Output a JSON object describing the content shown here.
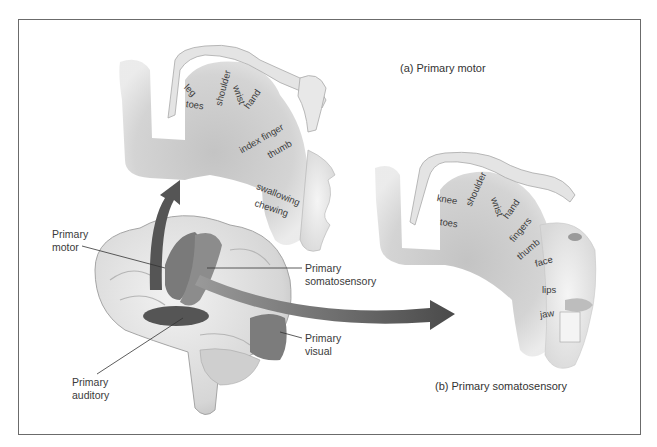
{
  "figure": {
    "captions": {
      "motor": "(a) Primary motor",
      "somatosensory": "(b) Primary somatosensory"
    },
    "brain_labels": {
      "primary_motor": [
        "Primary",
        "motor"
      ],
      "primary_somatosensory": [
        "Primary",
        "somatosensory"
      ],
      "primary_visual": [
        "Primary",
        "visual"
      ],
      "primary_auditory": [
        "Primary",
        "auditory"
      ]
    },
    "motor_homunculus_labels": [
      "leg",
      "toes",
      "shoulder",
      "wrist",
      "hand",
      "index finger",
      "thumb",
      "swallowing",
      "chewing"
    ],
    "somatosensory_homunculus_labels": [
      "knee",
      "toes",
      "shoulder",
      "wrist",
      "hand",
      "fingers",
      "thumb",
      "face",
      "lips",
      "jaw"
    ],
    "colors": {
      "frame": "#6b6b6b",
      "cortex_strip": "#c9c9c9",
      "motor_region": "#7a7a7a",
      "somatosensory_region": "#8c8c8c",
      "auditory_region": "#555555",
      "visual_region": "#7c7c7c",
      "arrow": "#555555",
      "brain": "#e6e6e6"
    }
  }
}
